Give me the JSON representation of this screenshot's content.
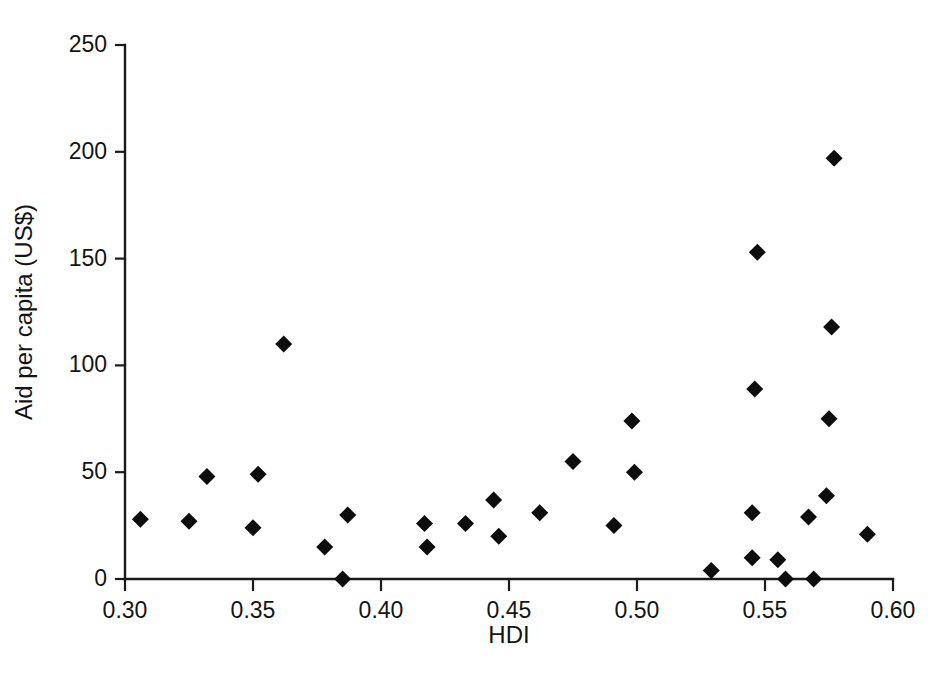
{
  "figure": {
    "background_color": "#ffffff",
    "marker_color": "#0d0d0d",
    "axis_color": "#1a1a1a",
    "marker_shape": "diamond",
    "marker_size_px": 17
  },
  "chart_data": {
    "type": "scatter",
    "title": "",
    "xlabel": "HDI",
    "ylabel": "Aid per capita (US$)",
    "xlim": [
      0.3,
      0.6
    ],
    "ylim": [
      0,
      250
    ],
    "xticks": [
      0.3,
      0.35,
      0.4,
      0.45,
      0.5,
      0.55,
      0.6
    ],
    "xtick_labels": [
      "0.30",
      "0.35",
      "0.40",
      "0.45",
      "0.50",
      "0.55",
      "0.60"
    ],
    "yticks": [
      0,
      50,
      100,
      150,
      200,
      250
    ],
    "ytick_labels": [
      "0",
      "50",
      "100",
      "150",
      "200",
      "250"
    ],
    "grid": false,
    "legend": null,
    "legend_position": "none",
    "series": [
      {
        "name": "Countries",
        "marker": "diamond",
        "color": "#0d0d0d",
        "points": [
          {
            "x": 0.306,
            "y": 28
          },
          {
            "x": 0.325,
            "y": 27
          },
          {
            "x": 0.332,
            "y": 48
          },
          {
            "x": 0.35,
            "y": 24
          },
          {
            "x": 0.352,
            "y": 49
          },
          {
            "x": 0.362,
            "y": 110
          },
          {
            "x": 0.378,
            "y": 15
          },
          {
            "x": 0.385,
            "y": 0
          },
          {
            "x": 0.387,
            "y": 30
          },
          {
            "x": 0.417,
            "y": 26
          },
          {
            "x": 0.418,
            "y": 15
          },
          {
            "x": 0.433,
            "y": 26
          },
          {
            "x": 0.444,
            "y": 37
          },
          {
            "x": 0.446,
            "y": 20
          },
          {
            "x": 0.462,
            "y": 31
          },
          {
            "x": 0.475,
            "y": 55
          },
          {
            "x": 0.491,
            "y": 25
          },
          {
            "x": 0.498,
            "y": 74
          },
          {
            "x": 0.499,
            "y": 50
          },
          {
            "x": 0.529,
            "y": 4
          },
          {
            "x": 0.545,
            "y": 10
          },
          {
            "x": 0.545,
            "y": 31
          },
          {
            "x": 0.546,
            "y": 89
          },
          {
            "x": 0.547,
            "y": 153
          },
          {
            "x": 0.555,
            "y": 9
          },
          {
            "x": 0.558,
            "y": 0
          },
          {
            "x": 0.567,
            "y": 29
          },
          {
            "x": 0.569,
            "y": 0
          },
          {
            "x": 0.574,
            "y": 39
          },
          {
            "x": 0.575,
            "y": 75
          },
          {
            "x": 0.576,
            "y": 118
          },
          {
            "x": 0.577,
            "y": 197
          },
          {
            "x": 0.59,
            "y": 21
          }
        ]
      }
    ]
  }
}
